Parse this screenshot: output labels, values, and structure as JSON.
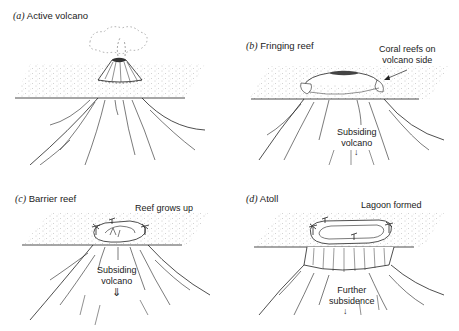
{
  "panels": [
    {
      "id": "a",
      "letter": "(a)",
      "title": "Active volcano",
      "annotations": []
    },
    {
      "id": "b",
      "letter": "(b)",
      "title": "Fringing reef",
      "annotations": [
        {
          "lines": [
            "Coral reefs on",
            "volcano side"
          ]
        },
        {
          "lines": [
            "Subsiding",
            "volcano"
          ]
        }
      ]
    },
    {
      "id": "c",
      "letter": "(c)",
      "title": "Barrier reef",
      "annotations": [
        {
          "lines": [
            "Reef grows up"
          ]
        },
        {
          "lines": [
            "Subsiding",
            "volcano"
          ]
        }
      ]
    },
    {
      "id": "d",
      "letter": "(d)",
      "title": "Atoll",
      "annotations": [
        {
          "lines": [
            "Lagoon formed"
          ]
        },
        {
          "lines": [
            "Further",
            "subsidence"
          ]
        }
      ]
    }
  ],
  "arrows": {
    "down_arrow_glyph": "↓",
    "double_down_arrow_glyph": "⇓"
  },
  "colors": {
    "ink": "#222222",
    "stipple": "#8a8a8a",
    "background": "#ffffff"
  }
}
